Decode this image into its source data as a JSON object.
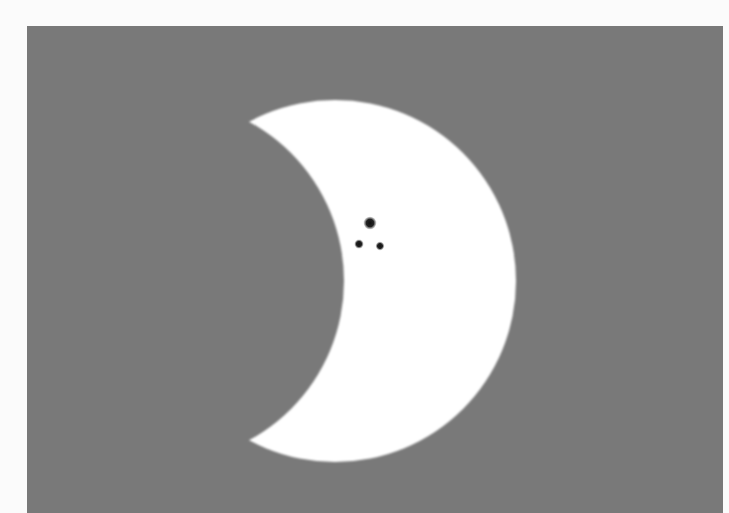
{
  "scene": {
    "subject": "partial solar eclipse with sunspots",
    "colors": {
      "page_border": "#fbfbfb",
      "sky": "#797979",
      "sun": "#ffffff",
      "sunspot": "#151515"
    },
    "sun": {
      "cx": 335,
      "cy": 281,
      "r": 181
    },
    "moon": {
      "cx": 163,
      "cy": 281,
      "r": 181
    },
    "sunspots": [
      {
        "cx": 370,
        "cy": 223,
        "r": 4.5
      },
      {
        "cx": 359,
        "cy": 244,
        "r": 3.2
      },
      {
        "cx": 380,
        "cy": 246,
        "r": 3
      }
    ]
  }
}
